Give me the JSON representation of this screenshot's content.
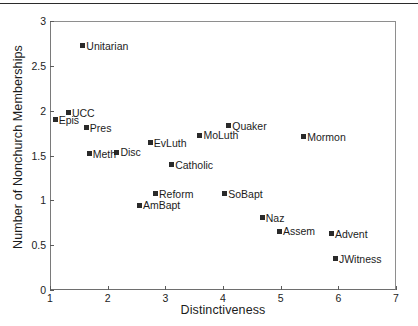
{
  "figure": {
    "page_rule": true
  },
  "chart_data": {
    "type": "scatter",
    "title": "",
    "xlabel": "Distinctiveness",
    "ylabel": "Number of Nonchurch Memberships",
    "xlim": [
      1,
      7
    ],
    "ylim": [
      0,
      3
    ],
    "xticks": [
      "1",
      "2",
      "3",
      "4",
      "5",
      "6",
      "7"
    ],
    "yticks": [
      "0",
      "0.5",
      "1",
      "1.5",
      "2",
      "2.5",
      "3"
    ],
    "grid": false,
    "legend": "none",
    "marker_color": "#2a2a2a",
    "points": [
      {
        "label": "Unitarian",
        "x": 1.57,
        "y": 2.78,
        "label_side": "right"
      },
      {
        "label": "UCC",
        "x": 1.32,
        "y": 2.03,
        "label_side": "right"
      },
      {
        "label": "Epis",
        "x": 1.09,
        "y": 1.95,
        "label_side": "right"
      },
      {
        "label": "Pres",
        "x": 1.63,
        "y": 1.86,
        "label_side": "right"
      },
      {
        "label": "MoLuth",
        "x": 3.6,
        "y": 1.78,
        "label_side": "right"
      },
      {
        "label": "Mormon",
        "x": 5.4,
        "y": 1.76,
        "label_side": "right"
      },
      {
        "label": "EvLuth",
        "x": 2.74,
        "y": 1.7,
        "label_side": "right"
      },
      {
        "label": "Quaker",
        "x": 4.1,
        "y": 1.89,
        "label_side": "right"
      },
      {
        "label": "Disc",
        "x": 2.16,
        "y": 1.59,
        "label_side": "right"
      },
      {
        "label": "Meth",
        "x": 1.68,
        "y": 1.57,
        "label_side": "right"
      },
      {
        "label": "Catholic",
        "x": 3.11,
        "y": 1.45,
        "label_side": "right"
      },
      {
        "label": "Reform",
        "x": 2.83,
        "y": 1.13,
        "label_side": "right"
      },
      {
        "label": "SoBapt",
        "x": 4.03,
        "y": 1.13,
        "label_side": "right"
      },
      {
        "label": "AmBapt",
        "x": 2.55,
        "y": 1.0,
        "label_side": "right"
      },
      {
        "label": "Naz",
        "x": 4.68,
        "y": 0.86,
        "label_side": "right"
      },
      {
        "label": "Assem",
        "x": 4.98,
        "y": 0.71,
        "label_side": "right"
      },
      {
        "label": "Advent",
        "x": 5.88,
        "y": 0.68,
        "label_side": "right"
      },
      {
        "label": "JWitness",
        "x": 5.95,
        "y": 0.4,
        "label_side": "right"
      }
    ]
  }
}
